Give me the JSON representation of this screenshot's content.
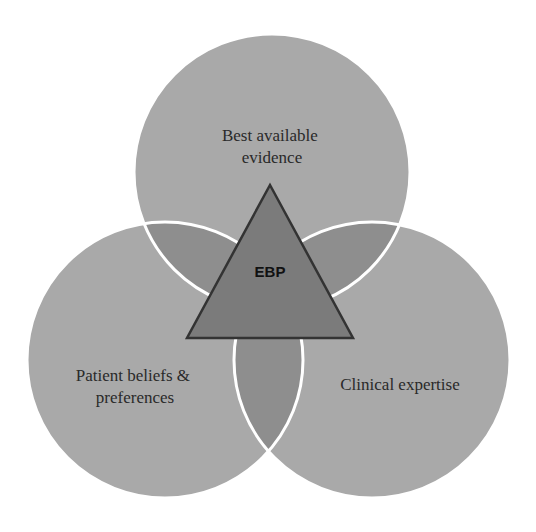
{
  "diagram": {
    "type": "venn",
    "circles": [
      {
        "id": "evidence",
        "label_lines": [
          "Best available",
          "evidence"
        ]
      },
      {
        "id": "patient",
        "label_lines": [
          "Patient beliefs &",
          "preferences"
        ]
      },
      {
        "id": "clinical",
        "label_lines": [
          "Clinical expertise"
        ]
      }
    ],
    "center": {
      "label": "EBP"
    },
    "colors": {
      "circle_fill": "#a9a9a9",
      "overlap_fill": "#8e8e8e",
      "circle_border": "#ffffff",
      "triangle_fill": "#7b7b7b",
      "triangle_stroke": "#333333"
    }
  }
}
